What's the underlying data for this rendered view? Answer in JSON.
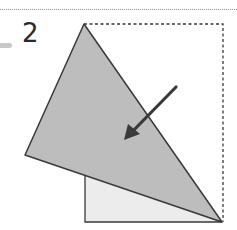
{
  "step": {
    "number": "2"
  },
  "diagram": {
    "colors": {
      "folded_flap": "#bdbdbd",
      "under_layer": "#ececec",
      "outline": "#3a3a3a",
      "dashed": "#3a3a3a",
      "arrow": "#3a3a3a"
    },
    "icons": [
      "fold-arrow-icon"
    ]
  }
}
